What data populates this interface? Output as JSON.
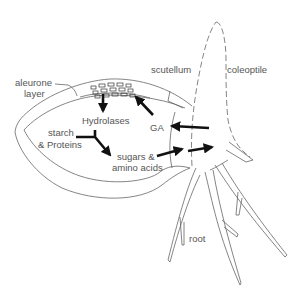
{
  "diagram": {
    "labels": {
      "aleurone_line1": "aleurone",
      "aleurone_line2": "layer",
      "scutellum": "scutellum",
      "coleoptile": "coleoptile",
      "hydrolases": "Hydrolases",
      "starch_line1": "starch",
      "starch_line2": "& Proteins",
      "ga": "GA",
      "sugars_line1": "sugars &",
      "sugars_line2": "amino acids",
      "root": "root"
    },
    "arrows": [
      {
        "from": "aleurone layer",
        "to": "Hydrolases"
      },
      {
        "from": "GA",
        "to": "aleurone layer"
      },
      {
        "from": "embryo",
        "to": "GA"
      },
      {
        "from": "starch & Proteins",
        "to": "sugars & amino acids"
      },
      {
        "from": "sugars & amino acids",
        "to": "embryo"
      }
    ],
    "colors": {
      "outline": "#666666",
      "arrow": "#111111",
      "text": "#555555"
    }
  }
}
